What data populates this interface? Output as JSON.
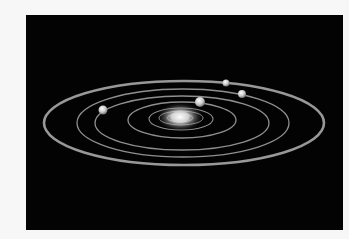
{
  "image": {
    "subject": "solar system illustration",
    "background_color": "#030303",
    "page_color": "#f7f7f7",
    "orbit_color": "#bdbdbd",
    "sun": {
      "cx": 154,
      "cy": 102,
      "glow_color": "#ffffff"
    },
    "orbits": [
      {
        "cx": 158,
        "cy": 108,
        "rx": 140,
        "ry": 42,
        "width": 2.6
      },
      {
        "cx": 157,
        "cy": 108,
        "rx": 106,
        "ry": 34,
        "width": 1.3
      },
      {
        "cx": 156,
        "cy": 108,
        "rx": 87,
        "ry": 27,
        "width": 1.3
      },
      {
        "cx": 156,
        "cy": 105,
        "rx": 54,
        "ry": 18,
        "width": 1.3
      },
      {
        "cx": 155,
        "cy": 104,
        "rx": 32,
        "ry": 11,
        "width": 1.1
      },
      {
        "cx": 155,
        "cy": 103,
        "rx": 22,
        "ry": 7,
        "width": 1.0
      },
      {
        "cx": 154,
        "cy": 103,
        "rx": 13,
        "ry": 4,
        "width": 0.9
      }
    ],
    "planets": [
      {
        "cx": 77,
        "cy": 95,
        "r": 4.5
      },
      {
        "cx": 174,
        "cy": 87,
        "r": 5
      },
      {
        "cx": 200,
        "cy": 68,
        "r": 3.5
      },
      {
        "cx": 216,
        "cy": 79,
        "r": 4
      }
    ]
  }
}
